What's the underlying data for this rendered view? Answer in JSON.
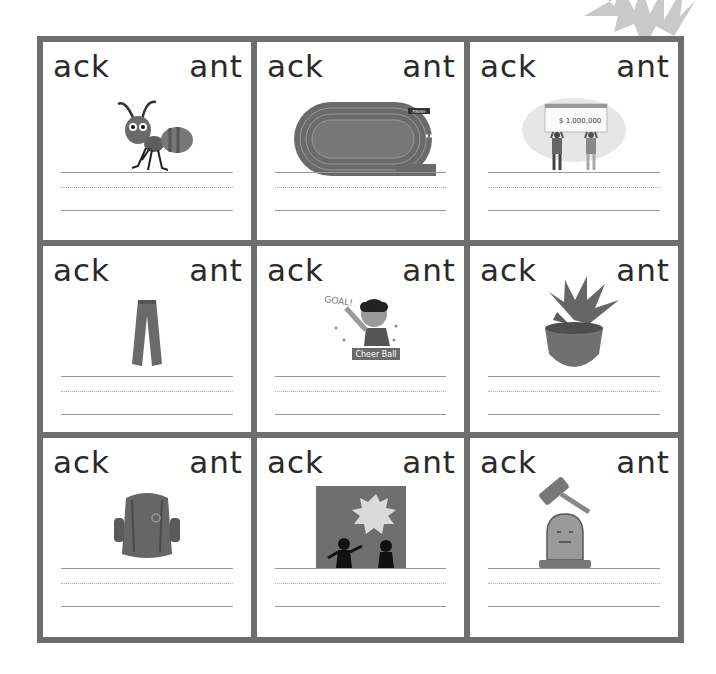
{
  "worksheet": {
    "cards": [
      {
        "left": "ack",
        "right": "ant",
        "picture": "ant"
      },
      {
        "left": "ack",
        "right": "ant",
        "picture": "running-track",
        "label": "FINISH"
      },
      {
        "left": "ack",
        "right": "ant",
        "picture": "giant-check",
        "amount": "$ 1,000,000"
      },
      {
        "left": "ack",
        "right": "ant",
        "picture": "pants"
      },
      {
        "left": "ack",
        "right": "ant",
        "picture": "cheering-fan",
        "shout": "GOAL!",
        "caption": "Cheer Ball"
      },
      {
        "left": "ack",
        "right": "ant",
        "picture": "potted-plant"
      },
      {
        "left": "ack",
        "right": "ant",
        "picture": "backpack"
      },
      {
        "left": "ack",
        "right": "ant",
        "picture": "attack-scene"
      },
      {
        "left": "ack",
        "right": "ant",
        "picture": "gavel-and-tombstone"
      }
    ]
  },
  "colors": {
    "frame": "#6e6e6e",
    "text": "#2a2a2a",
    "art": "#6a6a6a",
    "guide_line": "#9a9a9a"
  }
}
